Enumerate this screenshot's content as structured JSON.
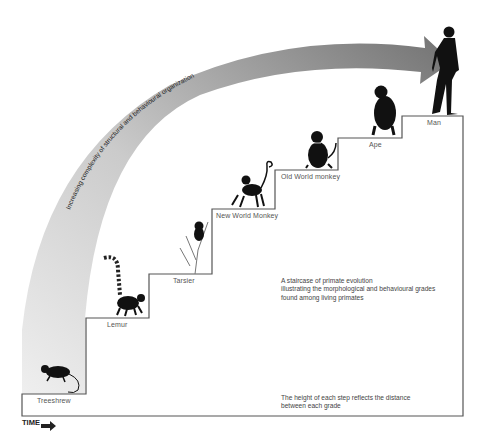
{
  "title": "A staircase of primate evolution",
  "arrow": {
    "label": "Increasing complexity of structural and behavioural organization",
    "color_start": "#e6e6e6",
    "color_end": "#6e6e6e"
  },
  "steps": [
    {
      "label": "Treeshrew",
      "animal": "treeshrew"
    },
    {
      "label": "Lemur",
      "animal": "lemur"
    },
    {
      "label": "Tarsier",
      "animal": "tarsier"
    },
    {
      "label": "New World Monkey",
      "animal": "new-world-monkey"
    },
    {
      "label": "Old World monkey",
      "animal": "old-world-monkey"
    },
    {
      "label": "Ape",
      "animal": "ape"
    },
    {
      "label": "Man",
      "animal": "man"
    }
  ],
  "captions": {
    "main_line1": "A staircase of primate evolution",
    "main_line2": "illustrating the morphological and behavioural grades",
    "main_line3": "found among living primates",
    "note_line1": "The height of each step reflects the distance",
    "note_line2": "between each grade"
  },
  "axis": {
    "time_label": "TIME"
  }
}
